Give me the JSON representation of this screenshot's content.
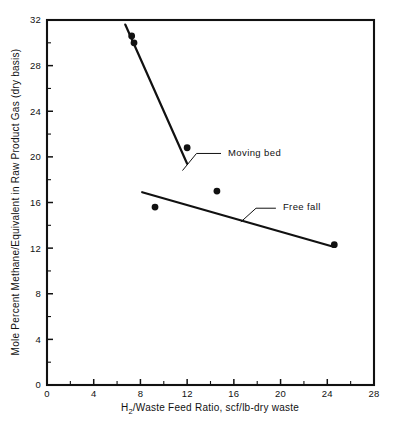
{
  "chart_data": {
    "type": "scatter",
    "title": "",
    "xlabel": "H2/Waste Feed Ratio,  scf/lb-dry waste",
    "xlabel_pre": "H",
    "xlabel_sub": "2",
    "xlabel_post": "/Waste Feed Ratio,  scf/lb-dry waste",
    "ylabel": "Mole Percent Methane/Equivalent in Raw Product Gas (dry basis)",
    "xlim": [
      0,
      28
    ],
    "ylim": [
      0,
      32
    ],
    "xticks": [
      0,
      4,
      8,
      12,
      16,
      20,
      24,
      28
    ],
    "xtick_labels": [
      "0",
      "4",
      "8",
      "12",
      "16",
      "20",
      "24",
      "28"
    ],
    "yticks": [
      0,
      4,
      8,
      12,
      16,
      20,
      24,
      28,
      32
    ],
    "ytick_labels": [
      "0",
      "4",
      "8",
      "12",
      "16",
      "20",
      "24",
      "28",
      "32"
    ],
    "x_minor_interval": 2,
    "y_minor_interval": 2,
    "grid": false,
    "legend_position": "inline-annotations",
    "series": [
      {
        "name": "Moving bed",
        "marker": "filled-circle",
        "points": [
          {
            "x": 7.25,
            "y": 30.6
          },
          {
            "x": 7.45,
            "y": 30.0
          },
          {
            "x": 12.0,
            "y": 20.8
          }
        ],
        "fit_line": {
          "x1": 6.7,
          "y1": 31.6,
          "x2": 12.0,
          "y2": 19.4
        }
      },
      {
        "name": "Free fall",
        "marker": "filled-circle",
        "points": [
          {
            "x": 9.25,
            "y": 15.6
          },
          {
            "x": 14.55,
            "y": 17.0
          },
          {
            "x": 24.6,
            "y": 12.3
          }
        ],
        "fit_line": {
          "x1": 8.15,
          "y1": 16.9,
          "x2": 24.6,
          "y2": 12.1
        }
      }
    ],
    "annotations": [
      {
        "text": "Moving bed",
        "label_x": 15.5,
        "label_y": 20.4,
        "leader": [
          [
            14.9,
            20.3
          ],
          [
            12.8,
            20.3
          ],
          [
            11.6,
            18.8
          ]
        ]
      },
      {
        "text": "Free fall",
        "label_x": 20.2,
        "label_y": 15.6,
        "leader": [
          [
            19.6,
            15.5
          ],
          [
            17.9,
            15.5
          ],
          [
            16.6,
            14.3
          ]
        ]
      }
    ],
    "colors": {
      "axis": "#111111",
      "marker": "#111111",
      "line": "#111111",
      "background": "#ffffff"
    }
  }
}
